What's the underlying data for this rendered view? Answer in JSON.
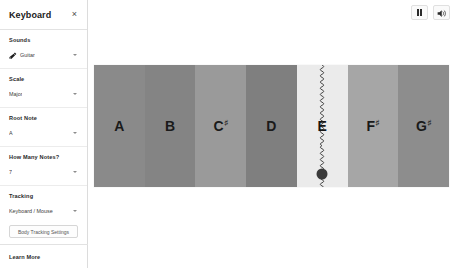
{
  "panel": {
    "title": "Keyboard",
    "close_icon": "close-icon",
    "close_label": "×"
  },
  "sidebar": {
    "sections": [
      {
        "label": "Sounds",
        "icon": "guitar-icon",
        "value": "Guitar",
        "control": "dropdown"
      },
      {
        "label": "Scale",
        "value": "Major",
        "control": "dropdown"
      },
      {
        "label": "Root Note",
        "value": "A",
        "control": "dropdown"
      },
      {
        "label": "How Many Notes?",
        "value": "7",
        "control": "dropdown"
      },
      {
        "label": "Tracking",
        "value": "Keyboard / Mouse",
        "control": "dropdown",
        "button_label": "Body Tracking Settings"
      }
    ],
    "footer": {
      "learn_more": "Learn More"
    }
  },
  "toolbar": {
    "pause_icon": "pause-icon",
    "pause_label": "",
    "volume_icon": "speaker-icon",
    "volume_label": ""
  },
  "keyboard": {
    "keys": [
      {
        "name": "A",
        "accidental": "",
        "shade": "#8a8a8a",
        "active": false
      },
      {
        "name": "B",
        "accidental": "",
        "shade": "#848484",
        "active": false
      },
      {
        "name": "C",
        "accidental": "♯",
        "shade": "#9a9a9a",
        "active": false
      },
      {
        "name": "D",
        "accidental": "",
        "shade": "#7f7f7f",
        "active": false
      },
      {
        "name": "E",
        "accidental": "",
        "shade": "#ebebeb",
        "active": true
      },
      {
        "name": "F",
        "accidental": "♯",
        "shade": "#a6a6a6",
        "active": false
      },
      {
        "name": "G",
        "accidental": "♯",
        "shade": "#8d8d8d",
        "active": false
      }
    ],
    "cursor": {
      "key_index": 4,
      "vertical_position_pct": 89
    }
  },
  "colors": {
    "panel_background": "#ffffff",
    "page_background": "#e9e9e9",
    "border": "#dcdcdc",
    "text_primary": "#1b1b1b",
    "text_secondary": "#3d3d3d",
    "cursor_dot": "#3a3a3a"
  }
}
